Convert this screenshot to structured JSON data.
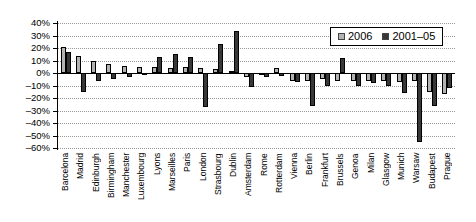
{
  "chart_data": {
    "type": "bar",
    "title": "",
    "categories": [
      "Barcelona",
      "Madrid",
      "Edinburgh",
      "Birmingham",
      "Manchester",
      "Luxembourg",
      "Lyons",
      "Marseilles",
      "Paris",
      "London",
      "Strasbourg",
      "Dublin",
      "Amsterdam",
      "Rome",
      "Rotterdam",
      "Vienna",
      "Berlin",
      "Frankfurt",
      "Brussels",
      "Genoa",
      "Milan",
      "Glasgow",
      "Munich",
      "Warsaw",
      "Budapest",
      "Prague"
    ],
    "series": [
      {
        "name": "2006",
        "color": "#b3b3b3",
        "values": [
          21,
          14,
          10,
          7,
          6,
          5,
          5,
          4,
          5,
          4,
          3,
          2,
          -3,
          -1,
          4,
          -6,
          -6,
          -5,
          -6,
          -6,
          -6,
          -6,
          -7,
          -6,
          -15,
          -17
        ]
      },
      {
        "name": "2001–05",
        "color": "#383838",
        "values": [
          17,
          -15,
          -6,
          -5,
          -3,
          -1,
          13,
          15,
          13,
          -27,
          23,
          34,
          -11,
          -3,
          -2,
          -7,
          -26,
          -10,
          12,
          -10,
          -8,
          -10,
          -16,
          -55,
          -26,
          -12
        ]
      }
    ],
    "xlabel": "",
    "ylabel": "",
    "ylim": [
      -60,
      40
    ],
    "ytick_step": 10,
    "ytick_labels": [
      "40%",
      "30%",
      "20%",
      "10%",
      "0%",
      "–10%",
      "–20%",
      "–30%",
      "–40%",
      "–50%",
      "–60%"
    ],
    "grid": "horizontal-dotted",
    "legend_position": "top-right"
  },
  "legend": {
    "items": [
      {
        "label": "2006"
      },
      {
        "label": "2001–05"
      }
    ]
  }
}
